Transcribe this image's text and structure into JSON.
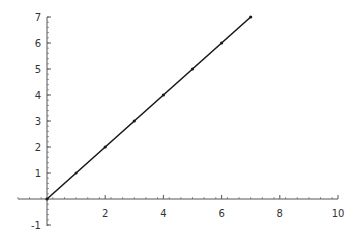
{
  "chart_data": {
    "type": "line",
    "title": "",
    "xlabel": "",
    "ylabel": "",
    "xlim": [
      -1,
      10
    ],
    "ylim": [
      -1,
      7
    ],
    "grid": false,
    "legend": null,
    "x_ticks": [
      2,
      4,
      6,
      8,
      10
    ],
    "y_ticks": [
      -1,
      1,
      2,
      3,
      4,
      5,
      6,
      7
    ],
    "series": [
      {
        "name": "y = x",
        "x": [
          0,
          1,
          2,
          3,
          4,
          5,
          6,
          7
        ],
        "y": [
          0,
          1,
          2,
          3,
          4,
          5,
          6,
          7
        ],
        "color": "#1a1a1a",
        "markers": true
      }
    ]
  },
  "style": {
    "axis_color": "#555555",
    "line_color": "#1a1a1a",
    "background": "#ffffff"
  }
}
